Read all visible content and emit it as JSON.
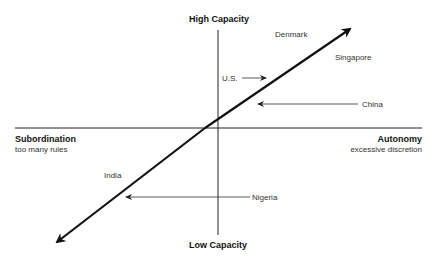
{
  "axes": {
    "top": "High Capacity",
    "bottom": "Low Capacity",
    "left": {
      "title": "Subordination",
      "subtitle": "too many rules"
    },
    "right": {
      "title": "Autonomy",
      "subtitle": "excessive discretion"
    }
  },
  "countries": [
    {
      "name": "Denmark",
      "pointer": "none"
    },
    {
      "name": "Singapore",
      "pointer": "none"
    },
    {
      "name": "U.S.",
      "pointer": "arrow-right"
    },
    {
      "name": "China",
      "pointer": "arrow-left"
    },
    {
      "name": "India",
      "pointer": "none"
    },
    {
      "name": "Nigeria",
      "pointer": "arrow-left"
    }
  ],
  "colors": {
    "line": "#111111",
    "thin_line": "#333333",
    "text": "#333333"
  }
}
